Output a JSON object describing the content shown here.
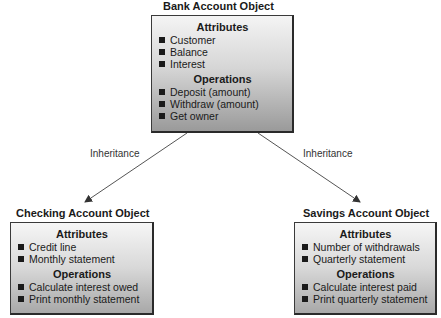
{
  "diagram": {
    "parent": {
      "title": "Bank Account Object",
      "attributes_heading": "Attributes",
      "attributes": [
        "Customer",
        "Balance",
        "Interest"
      ],
      "operations_heading": "Operations",
      "operations": [
        "Deposit (amount)",
        "Withdraw (amount)",
        "Get owner"
      ]
    },
    "children": [
      {
        "title": "Checking Account Object",
        "attributes_heading": "Attributes",
        "attributes": [
          "Credit line",
          "Monthly statement"
        ],
        "operations_heading": "Operations",
        "operations": [
          "Calculate interest owed",
          "Print monthly statement"
        ]
      },
      {
        "title": "Savings Account Object",
        "attributes_heading": "Attributes",
        "attributes": [
          "Number of withdrawals",
          "Quarterly statement"
        ],
        "operations_heading": "Operations",
        "operations": [
          "Calculate interest paid",
          "Print quarterly statement"
        ]
      }
    ],
    "edges": [
      {
        "from": "Bank Account Object",
        "to": "Checking Account Object",
        "label": "Inheritance"
      },
      {
        "from": "Bank Account Object",
        "to": "Savings Account Object",
        "label": "Inheritance"
      }
    ]
  }
}
